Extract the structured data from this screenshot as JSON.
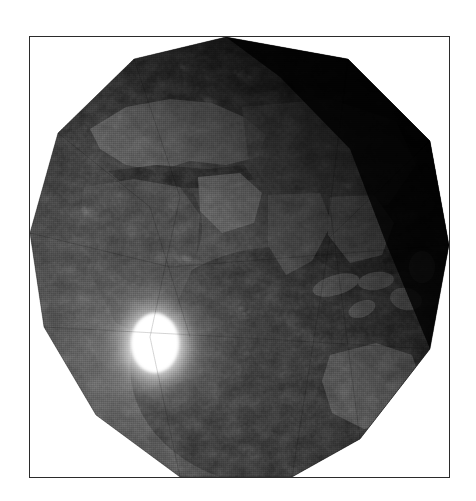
{
  "figure": {
    "domain": "natural-image",
    "caption": "",
    "title": "",
    "background_color": "#ffffff",
    "frame": {
      "border_color": "#2b2b2b",
      "border_width_px": 1,
      "x": 29,
      "y": 36,
      "width": 421,
      "height": 442
    }
  },
  "scene": {
    "description": "Low-polygon shaded relief globe of Earth rendered in grayscale with a bright specular highlight in the lower-left quadrant.",
    "render_style": "flat-faceted-polyhedral-sphere",
    "color_mode": "grayscale",
    "facet_count": 13,
    "globe": {
      "center_x": 240,
      "center_y": 255,
      "radius_px": 220,
      "base_color": "#3a3a3a",
      "dark_limb_color": "#050505",
      "terminator_side": "upper-right"
    },
    "specular_highlight": {
      "label": "sun-glint",
      "center_x": 155,
      "center_y": 345,
      "core_color": "#ffffff",
      "core_radius_px": 26,
      "glow_radius_px": 86,
      "shape": "ellipse"
    },
    "landmasses": [
      {
        "name": "Europe",
        "tone": "#6d6d6d"
      },
      {
        "name": "Mediterranean Sea",
        "tone": "#2c2c2c"
      },
      {
        "name": "Africa",
        "tone": "#4a4a4a"
      },
      {
        "name": "Arabian Peninsula",
        "tone": "#7a7a7a"
      },
      {
        "name": "Himalaya Range",
        "tone": "#9a9a9a"
      },
      {
        "name": "Indian Subcontinent",
        "tone": "#565656"
      },
      {
        "name": "Southeast Asia",
        "tone": "#5f5f5f"
      },
      {
        "name": "Indonesian Archipelago",
        "tone": "#6a6a6a"
      },
      {
        "name": "Australia",
        "tone": "#585858"
      },
      {
        "name": "Indian Ocean",
        "tone": "#2f2f2f"
      },
      {
        "name": "Asia Interior",
        "tone": "#1c1c1c"
      }
    ],
    "palette": {
      "paper_white": "#ffffff",
      "frame_ink": "#2b2b2b",
      "ocean_mid": "#343434",
      "ocean_dark": "#0b0b0b",
      "land_mid": "#5a5a5a",
      "ridge_light": "#b4b4b4",
      "highlight_white": "#ffffff"
    }
  }
}
